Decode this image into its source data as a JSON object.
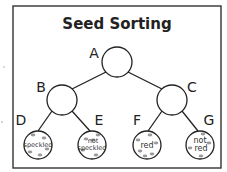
{
  "title": "Seed Sorting",
  "nodes": {
    "A": {
      "label": "A",
      "text": ""
    },
    "B": {
      "label": "B",
      "text": ""
    },
    "C": {
      "label": "C",
      "text": ""
    },
    "D": {
      "label": "D",
      "text": "speckled"
    },
    "E": {
      "label": "E",
      "text_line1": "not",
      "text_line2": "speckled"
    },
    "F": {
      "label": "F",
      "text": "red"
    },
    "G": {
      "label": "G",
      "text_line1": "not",
      "text_line2": "red"
    }
  },
  "edges": [
    [
      "A",
      "B"
    ],
    [
      "A",
      "C"
    ],
    [
      "B",
      "D"
    ],
    [
      "B",
      "E"
    ],
    [
      "C",
      "F"
    ],
    [
      "C",
      "G"
    ]
  ],
  "colors": {
    "line": "#222222",
    "speck": "#9a9a9a",
    "background": "#ffffff"
  }
}
